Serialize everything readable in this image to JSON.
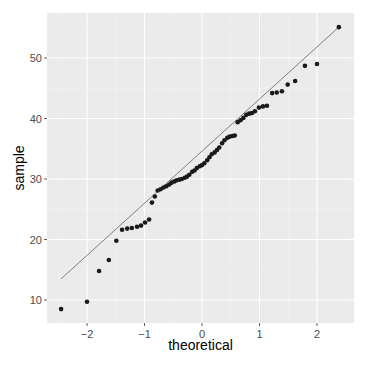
{
  "chart_data": {
    "type": "scatter",
    "subtype": "qq-plot",
    "title": "",
    "xlabel": "theoretical",
    "ylabel": "sample",
    "xlim": [
      -2.6,
      2.75
    ],
    "ylim": [
      6.7,
      58
    ],
    "x_ticks": [
      -2,
      -1,
      0,
      1,
      2
    ],
    "y_ticks": [
      10,
      20,
      30,
      40,
      50
    ],
    "grid": true,
    "legend": null,
    "points": [
      {
        "x": -2.45,
        "y": 8.5
      },
      {
        "x": -2.0,
        "y": 9.7
      },
      {
        "x": -1.79,
        "y": 14.8
      },
      {
        "x": -1.62,
        "y": 16.6
      },
      {
        "x": -1.49,
        "y": 19.8
      },
      {
        "x": -1.39,
        "y": 21.6
      },
      {
        "x": -1.3,
        "y": 21.8
      },
      {
        "x": -1.22,
        "y": 21.9
      },
      {
        "x": -1.13,
        "y": 22.1
      },
      {
        "x": -1.06,
        "y": 22.3
      },
      {
        "x": -0.99,
        "y": 22.8
      },
      {
        "x": -0.92,
        "y": 23.3
      },
      {
        "x": -0.87,
        "y": 26.1
      },
      {
        "x": -0.82,
        "y": 27.1
      },
      {
        "x": -0.77,
        "y": 28.1
      },
      {
        "x": -0.72,
        "y": 28.3
      },
      {
        "x": -0.67,
        "y": 28.6
      },
      {
        "x": -0.62,
        "y": 28.8
      },
      {
        "x": -0.57,
        "y": 29.1
      },
      {
        "x": -0.53,
        "y": 29.4
      },
      {
        "x": -0.48,
        "y": 29.6
      },
      {
        "x": -0.44,
        "y": 29.8
      },
      {
        "x": -0.39,
        "y": 29.9
      },
      {
        "x": -0.35,
        "y": 30.0
      },
      {
        "x": -0.3,
        "y": 30.2
      },
      {
        "x": -0.26,
        "y": 30.4
      },
      {
        "x": -0.22,
        "y": 30.7
      },
      {
        "x": -0.17,
        "y": 31.2
      },
      {
        "x": -0.13,
        "y": 31.4
      },
      {
        "x": -0.09,
        "y": 31.8
      },
      {
        "x": -0.04,
        "y": 32.1
      },
      {
        "x": 0.0,
        "y": 32.3
      },
      {
        "x": 0.04,
        "y": 32.6
      },
      {
        "x": 0.09,
        "y": 33.1
      },
      {
        "x": 0.13,
        "y": 33.6
      },
      {
        "x": 0.17,
        "y": 34.1
      },
      {
        "x": 0.22,
        "y": 34.4
      },
      {
        "x": 0.26,
        "y": 34.8
      },
      {
        "x": 0.3,
        "y": 35.2
      },
      {
        "x": 0.35,
        "y": 35.9
      },
      {
        "x": 0.39,
        "y": 36.4
      },
      {
        "x": 0.44,
        "y": 36.8
      },
      {
        "x": 0.48,
        "y": 37.0
      },
      {
        "x": 0.53,
        "y": 37.1
      },
      {
        "x": 0.57,
        "y": 37.2
      },
      {
        "x": 0.62,
        "y": 39.4
      },
      {
        "x": 0.67,
        "y": 39.7
      },
      {
        "x": 0.72,
        "y": 40.1
      },
      {
        "x": 0.77,
        "y": 40.6
      },
      {
        "x": 0.82,
        "y": 40.8
      },
      {
        "x": 0.87,
        "y": 40.9
      },
      {
        "x": 0.92,
        "y": 41.2
      },
      {
        "x": 0.99,
        "y": 41.8
      },
      {
        "x": 1.06,
        "y": 42.0
      },
      {
        "x": 1.13,
        "y": 42.1
      },
      {
        "x": 1.22,
        "y": 44.2
      },
      {
        "x": 1.3,
        "y": 44.3
      },
      {
        "x": 1.39,
        "y": 44.5
      },
      {
        "x": 1.49,
        "y": 45.6
      },
      {
        "x": 1.62,
        "y": 46.2
      },
      {
        "x": 1.79,
        "y": 48.7
      },
      {
        "x": 2.0,
        "y": 49.0
      },
      {
        "x": 2.38,
        "y": 55.1
      }
    ],
    "reference_line": {
      "x1": -2.45,
      "y1": 13.5,
      "x2": 2.38,
      "y2": 55.1
    }
  },
  "style": {
    "panel_bg": "#ebebeb",
    "grid_major": "#ffffff",
    "grid_minor": "#f4f4f4",
    "point_color": "#1a1a1a",
    "line_color": "#808080",
    "tick_color": "#333333"
  }
}
